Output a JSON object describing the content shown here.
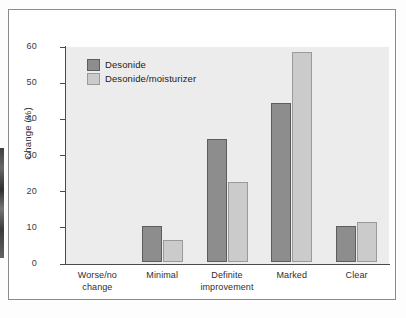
{
  "figure": {
    "background_color": "#ffffff",
    "plot_background_color": "#ececec",
    "border_color": "#8b8b8b"
  },
  "chart_data": {
    "type": "bar",
    "title": "",
    "subtitle": "",
    "xlabel": "",
    "ylabel": "Change (%)",
    "categories": [
      "Worse/no change",
      "Minimal",
      "Definite improvement",
      "Marked",
      "Clear"
    ],
    "category_lines": [
      [
        "Worse/no",
        "change"
      ],
      [
        "Minimal"
      ],
      [
        "Definite",
        "improvement"
      ],
      [
        "Marked"
      ],
      [
        "Clear"
      ]
    ],
    "series": [
      {
        "name": "Desonide",
        "color": "#8d8d8d",
        "values": [
          0,
          10,
          34,
          44,
          10
        ]
      },
      {
        "name": "Desonide/moisturizer",
        "color": "#cbcbcb",
        "values": [
          0,
          6,
          22,
          58,
          11
        ]
      }
    ],
    "ylim": [
      0,
      60
    ],
    "yticks": [
      0,
      10,
      20,
      30,
      40,
      50,
      60
    ],
    "ytick_labels": [
      "0",
      "10",
      "20",
      "30",
      "40",
      "50",
      "60"
    ],
    "grid": false,
    "legend_position": "top-left"
  }
}
